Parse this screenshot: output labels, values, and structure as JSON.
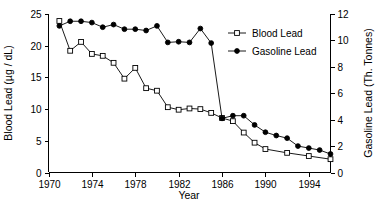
{
  "chart_data": {
    "type": "line",
    "title": "",
    "xlabel": "Year",
    "ylabel": "Blood Lead (µg / dL)",
    "y2label": "Gasoline Lead (Th. Tonnes)",
    "xlim": [
      1970,
      1996
    ],
    "ylim": [
      0,
      25
    ],
    "y2lim": [
      0,
      12
    ],
    "xticks": [
      1970,
      1974,
      1978,
      1982,
      1986,
      1990,
      1994
    ],
    "xtick_labels": [
      "1970",
      "1974",
      "1978",
      "1982",
      "1986",
      "1990",
      "1994"
    ],
    "yticks": [
      0,
      5,
      10,
      15,
      20,
      25
    ],
    "ytick_labels": [
      "0",
      "5",
      "10",
      "15",
      "20",
      "25"
    ],
    "y2ticks": [
      0,
      2,
      4,
      6,
      8,
      10,
      12
    ],
    "y2tick_labels": [
      "0",
      "2",
      "4",
      "6",
      "8",
      "10",
      "12"
    ],
    "grid": false,
    "legend_position": "upper right",
    "series": [
      {
        "name": "Blood Lead",
        "axis": "left",
        "marker": "open-square",
        "x": [
          1971,
          1972,
          1973,
          1974,
          1975,
          1976,
          1977,
          1978,
          1979,
          1980,
          1981,
          1982,
          1983,
          1984,
          1985,
          1986,
          1987,
          1988,
          1989,
          1990,
          1992,
          1994,
          1996
        ],
        "values": [
          23.9,
          19.2,
          20.6,
          18.7,
          18.4,
          17.3,
          14.8,
          16.5,
          13.3,
          12.9,
          10.3,
          9.9,
          10.1,
          10.0,
          9.4,
          8.6,
          8.1,
          6.3,
          4.7,
          3.7,
          3.1,
          2.6,
          2.1
        ]
      },
      {
        "name": "Gasoline Lead",
        "axis": "right",
        "marker": "filled-circle",
        "x": [
          1971,
          1972,
          1973,
          1974,
          1975,
          1976,
          1977,
          1978,
          1979,
          1980,
          1981,
          1982,
          1983,
          1984,
          1985,
          1986,
          1987,
          1988,
          1989,
          1990,
          1991,
          1992,
          1993,
          1994,
          1995,
          1996
        ],
        "values": [
          11.1,
          11.45,
          11.45,
          11.35,
          11.0,
          11.2,
          10.85,
          10.85,
          10.75,
          11.1,
          9.85,
          9.9,
          9.85,
          10.9,
          9.8,
          4.1,
          4.3,
          4.3,
          3.6,
          3.05,
          2.8,
          2.6,
          2.0,
          1.85,
          1.7,
          1.4
        ]
      }
    ]
  },
  "legend": {
    "entries": [
      {
        "label": "Blood Lead",
        "marker": "open-square"
      },
      {
        "label": "Gasoline Lead",
        "marker": "filled-circle"
      }
    ]
  },
  "axes": {
    "x_title": "Year",
    "y_left_title": "Blood Lead (µg / dL)",
    "y_right_title": "Gasoline Lead (Th. Tonnes)"
  },
  "colors": {
    "foreground": "#000000",
    "background": "#ffffff"
  }
}
